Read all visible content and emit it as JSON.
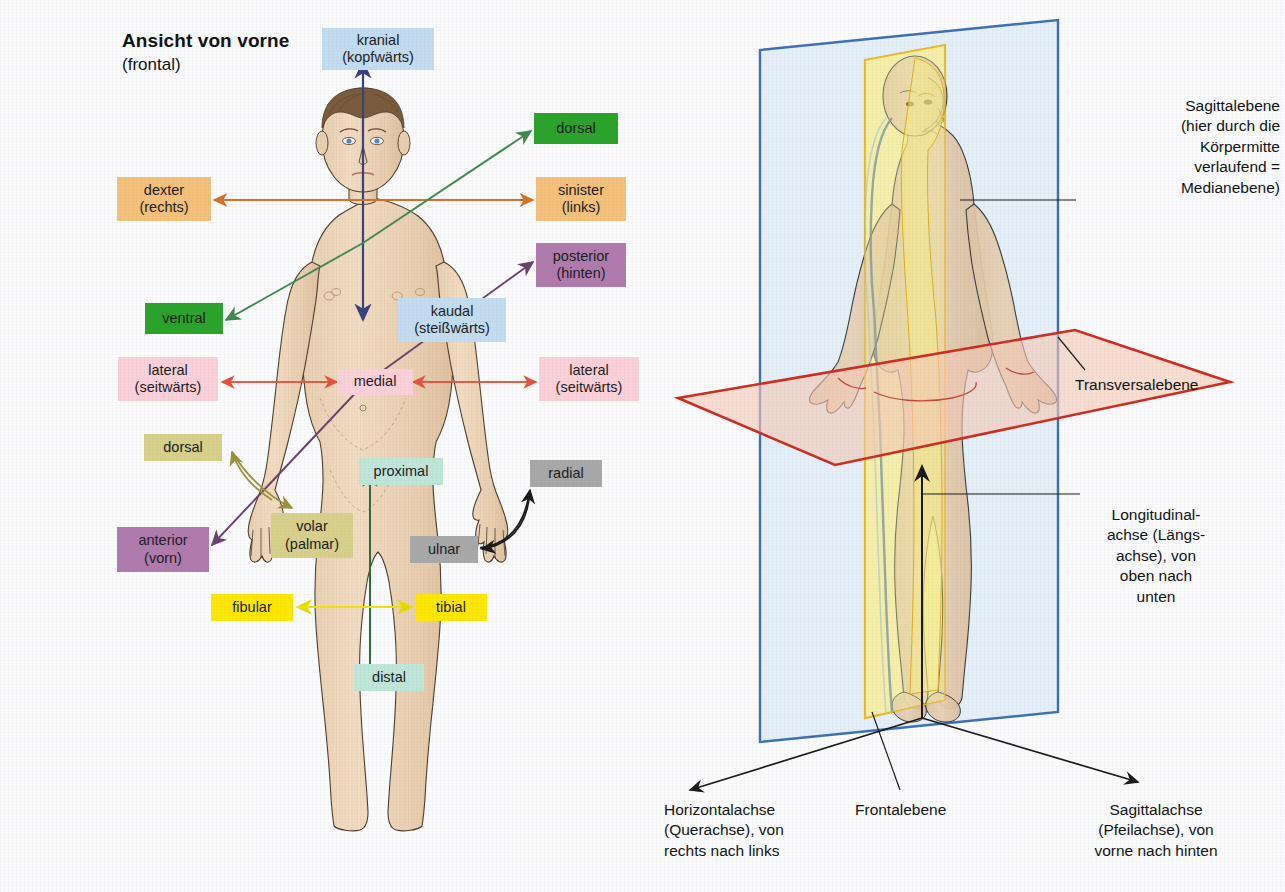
{
  "figure": {
    "heading_title": "Ansicht von vorne",
    "heading_subtitle": "(frontal)"
  },
  "colors": {
    "page_background": "#fbfbfc",
    "green": "#29a329",
    "orange": "#f5c07a",
    "purple": "#b07aad",
    "pink": "#fbd0d8",
    "lightblue": "#c3dcf0",
    "olive": "#d8d08a",
    "gray": "#a8a8a8",
    "yellow": "#ffe800",
    "mint": "#bfe6d8",
    "arrow_navy": "#3b3f7a",
    "arrow_green": "#3f8a4f",
    "arrow_orange": "#d4722a",
    "arrow_red": "#e8503a",
    "arrow_purple": "#6b3f6b",
    "arrow_olive": "#9a8f3a",
    "arrow_yellow": "#f2e400",
    "arrow_black": "#1a1a1a",
    "plane_frontal": "#3d6fb5",
    "plane_sagittal": "#e8b923",
    "plane_transverse": "#cf2b20",
    "skin": "#f0d8bd",
    "hair": "#7a5a3a"
  },
  "left_panel": {
    "labels": [
      {
        "key": "kranial",
        "line1": "kranial",
        "line2": "(kopfwärts)",
        "color": "lightblue",
        "x": 322,
        "y": 28,
        "w": 112,
        "h": 42
      },
      {
        "key": "dorsal_top",
        "line1": "dorsal",
        "line2": "",
        "color": "green",
        "x": 534,
        "y": 113,
        "w": 84,
        "h": 31
      },
      {
        "key": "dexter",
        "line1": "dexter",
        "line2": "(rechts)",
        "color": "orange",
        "x": 117,
        "y": 177,
        "w": 94,
        "h": 44
      },
      {
        "key": "sinister",
        "line1": "sinister",
        "line2": "(links)",
        "color": "orange",
        "x": 536,
        "y": 177,
        "w": 90,
        "h": 44
      },
      {
        "key": "posterior",
        "line1": "posterior",
        "line2": "(hinten)",
        "color": "purple",
        "x": 536,
        "y": 243,
        "w": 90,
        "h": 44
      },
      {
        "key": "ventral",
        "line1": "ventral",
        "line2": "",
        "color": "green",
        "x": 145,
        "y": 303,
        "w": 78,
        "h": 31
      },
      {
        "key": "kaudal",
        "line1": "kaudal",
        "line2": "(steißwärts)",
        "color": "lightblue",
        "x": 398,
        "y": 298,
        "w": 108,
        "h": 44
      },
      {
        "key": "lateral_l",
        "line1": "lateral",
        "line2": "(seitwärts)",
        "color": "pink",
        "x": 118,
        "y": 357,
        "w": 100,
        "h": 44
      },
      {
        "key": "medial",
        "line1": "medial",
        "line2": "",
        "color": "pink",
        "x": 337,
        "y": 369,
        "w": 76,
        "h": 26
      },
      {
        "key": "lateral_r",
        "line1": "lateral",
        "line2": "(seitwärts)",
        "color": "pink",
        "x": 539,
        "y": 357,
        "w": 100,
        "h": 44
      },
      {
        "key": "dorsal_hand",
        "line1": "dorsal",
        "line2": "",
        "color": "olive",
        "x": 144,
        "y": 434,
        "w": 78,
        "h": 27
      },
      {
        "key": "proximal",
        "line1": "proximal",
        "line2": "",
        "color": "mint",
        "x": 359,
        "y": 458,
        "w": 84,
        "h": 27
      },
      {
        "key": "radial",
        "line1": "radial",
        "line2": "",
        "color": "gray",
        "x": 530,
        "y": 460,
        "w": 72,
        "h": 27
      },
      {
        "key": "volar",
        "line1": "volar",
        "line2": "(palmar)",
        "color": "olive",
        "x": 271,
        "y": 513,
        "w": 82,
        "h": 45
      },
      {
        "key": "ulnar",
        "line1": "ulnar",
        "line2": "",
        "color": "gray",
        "x": 410,
        "y": 536,
        "w": 68,
        "h": 27
      },
      {
        "key": "anterior",
        "line1": "anterior",
        "line2": "(vorn)",
        "color": "purple",
        "x": 117,
        "y": 527,
        "w": 92,
        "h": 45
      },
      {
        "key": "fibular",
        "line1": "fibular",
        "line2": "",
        "color": "yellow",
        "x": 211,
        "y": 594,
        "w": 82,
        "h": 27
      },
      {
        "key": "tibial",
        "line1": "tibial",
        "line2": "",
        "color": "yellow",
        "x": 415,
        "y": 594,
        "w": 72,
        "h": 27
      },
      {
        "key": "distal",
        "line1": "distal",
        "line2": "",
        "color": "mint",
        "x": 354,
        "y": 664,
        "w": 70,
        "h": 27
      }
    ]
  },
  "right_panel": {
    "annotations": [
      {
        "key": "sagittalebene",
        "text": "Sagittalebene\n(hier durch die\nKörpermitte\nverlaufend =\nMedianebene)",
        "align": "right-al",
        "x": 1070,
        "y": 96,
        "w": 210
      },
      {
        "key": "transversalebene",
        "text": "Transversalebene",
        "align": "left-al",
        "x": 1075,
        "y": 375,
        "w": 195
      },
      {
        "key": "longitudinalachse",
        "text": "Longitudinal-\nachse (Längs-\nachse), von\noben nach\nunten",
        "align": "center-al",
        "x": 1076,
        "y": 505,
        "w": 160
      },
      {
        "key": "horizontalachse",
        "text": "Horizontalachse\n(Querachse), von\nrechts nach links",
        "align": "left-al",
        "x": 664,
        "y": 800,
        "w": 190
      },
      {
        "key": "frontalebene",
        "text": "Frontalebene",
        "align": "left-al",
        "x": 855,
        "y": 800,
        "w": 130
      },
      {
        "key": "sagittalachse",
        "text": "Sagittalachse\n(Pfeilachse), von\nvorne nach hinten",
        "align": "center-al",
        "x": 1056,
        "y": 800,
        "w": 200
      }
    ],
    "planes": [
      {
        "key": "frontal-plane",
        "name": "Frontalebene"
      },
      {
        "key": "sagittal-plane",
        "name": "Sagittalebene / Medianebene"
      },
      {
        "key": "transverse-plane",
        "name": "Transversalebene"
      }
    ],
    "axes": [
      {
        "key": "longitudinal-axis",
        "name": "Longitudinalachse"
      },
      {
        "key": "horizontal-axis",
        "name": "Horizontalachse"
      },
      {
        "key": "sagittal-axis",
        "name": "Sagittalachse"
      }
    ]
  }
}
